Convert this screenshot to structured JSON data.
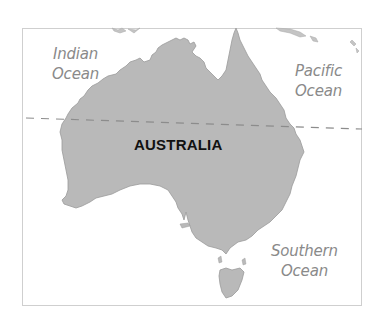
{
  "map": {
    "title": "Australia",
    "country_label": "AUSTRALIA",
    "oceans": [
      {
        "line1": "Indian",
        "line2": "Ocean"
      },
      {
        "line1": "Pacific",
        "line2": "Ocean"
      },
      {
        "line1": "Southern",
        "line2": "Ocean"
      }
    ],
    "features": {
      "tropic_line": "dashed",
      "land_color": "#b9b9b9",
      "coast_color": "#9a9a9a",
      "water_color": "#ffffff",
      "label_color": "#8a8a8a",
      "frame_color": "#cfcfcf"
    }
  }
}
